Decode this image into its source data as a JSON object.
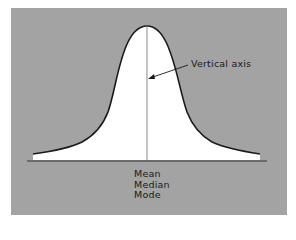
{
  "diagram": {
    "type": "normal-distribution-curve",
    "colors": {
      "background": "#a3a3a3",
      "curve_fill": "#ffffff",
      "curve_stroke": "#1a1a1a",
      "axis": "#8a8a8a"
    },
    "annotations": {
      "vertical_axis_label": "Vertical axis",
      "center_labels": [
        "Mean",
        "Median",
        "Mode"
      ]
    }
  }
}
